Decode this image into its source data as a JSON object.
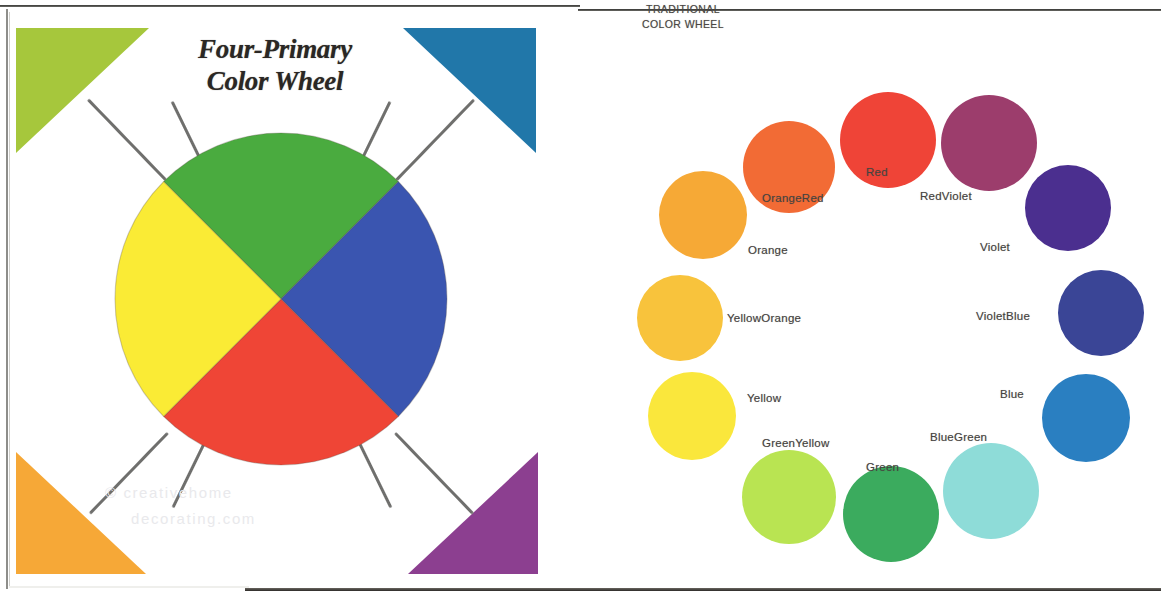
{
  "left_panel": {
    "title_line1": "Four-Primary",
    "title_line2": "Color Wheel",
    "watermark_line1": "© creativehome",
    "watermark_line2": "decorating.com",
    "wheel": {
      "type": "pie",
      "segments": [
        {
          "name": "Green",
          "color": "#4aab3f",
          "start_deg": 315,
          "end_deg": 45
        },
        {
          "name": "Blue",
          "color": "#3a55b0",
          "start_deg": 45,
          "end_deg": 135
        },
        {
          "name": "Red",
          "color": "#ef4536",
          "start_deg": 135,
          "end_deg": 225
        },
        {
          "name": "Yellow",
          "color": "#faeb35",
          "start_deg": 225,
          "end_deg": 315
        }
      ]
    },
    "corner_triangles": [
      {
        "position": "top-left",
        "name": "Yellow-Green",
        "color": "#a6c73c"
      },
      {
        "position": "top-right",
        "name": "Blue-Teal",
        "color": "#2177a9"
      },
      {
        "position": "bottom-left",
        "name": "Orange",
        "color": "#f6a837"
      },
      {
        "position": "bottom-right",
        "name": "Purple",
        "color": "#8c3f90"
      }
    ]
  },
  "right_panel": {
    "title_line1": "TRADITIONAL",
    "title_line2": "COLOR WHEEL",
    "swatches": [
      {
        "label": "Red",
        "color": "#ef4437",
        "cx": 888,
        "cy": 140,
        "r": 48,
        "lx": 866,
        "ly": 166
      },
      {
        "label": "OrangeRed",
        "color": "#f26b35",
        "cx": 789,
        "cy": 167,
        "r": 46,
        "lx": 762,
        "ly": 192
      },
      {
        "label": "Orange",
        "color": "#f6a936",
        "cx": 703,
        "cy": 215,
        "r": 44,
        "lx": 748,
        "ly": 244
      },
      {
        "label": "YellowOrange",
        "color": "#f8c33c",
        "cx": 680,
        "cy": 318,
        "r": 43,
        "lx": 727,
        "ly": 312
      },
      {
        "label": "Yellow",
        "color": "#fae73c",
        "cx": 692,
        "cy": 416,
        "r": 44,
        "lx": 747,
        "ly": 392
      },
      {
        "label": "GreenYellow",
        "color": "#b9e452",
        "cx": 789,
        "cy": 497,
        "r": 47,
        "lx": 762,
        "ly": 437
      },
      {
        "label": "Green",
        "color": "#3bab5e",
        "cx": 891,
        "cy": 514,
        "r": 48,
        "lx": 866,
        "ly": 461
      },
      {
        "label": "BlueGreen",
        "color": "#8edcd8",
        "cx": 991,
        "cy": 491,
        "r": 48,
        "lx": 930,
        "ly": 431
      },
      {
        "label": "Blue",
        "color": "#2a7fc1",
        "cx": 1086,
        "cy": 418,
        "r": 44,
        "lx": 1000,
        "ly": 388
      },
      {
        "label": "VioletBlue",
        "color": "#3a4596",
        "cx": 1101,
        "cy": 313,
        "r": 43,
        "lx": 976,
        "ly": 310
      },
      {
        "label": "Violet",
        "color": "#4b2f8f",
        "cx": 1068,
        "cy": 208,
        "r": 43,
        "lx": 980,
        "ly": 241
      },
      {
        "label": "RedViolet",
        "color": "#9c3d6c",
        "cx": 989,
        "cy": 143,
        "r": 48,
        "lx": 920,
        "ly": 190
      }
    ]
  },
  "connectors": [
    {
      "x": 78,
      "y": 86,
      "len": 112,
      "angle": 46
    },
    {
      "x": 162,
      "y": 88,
      "len": 87,
      "angle": 64
    },
    {
      "x": 464,
      "y": 86,
      "len": 112,
      "angle": 134
    },
    {
      "x": 380,
      "y": 88,
      "len": 87,
      "angle": 116
    },
    {
      "x": 80,
      "y": 500,
      "len": 112,
      "angle": -46
    },
    {
      "x": 163,
      "y": 494,
      "len": 86,
      "angle": -64
    },
    {
      "x": 463,
      "y": 500,
      "len": 112,
      "angle": 226
    },
    {
      "x": 381,
      "y": 494,
      "len": 86,
      "angle": 244
    }
  ]
}
